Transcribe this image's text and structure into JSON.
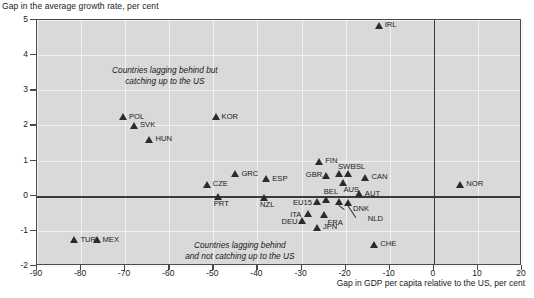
{
  "axes": {
    "y_title": "Gap in the average growth rate, per cent",
    "x_title": "Gap in GDP per capita relative to the US, per cent",
    "y_ticks": [
      "5",
      "4",
      "3",
      "2",
      "1",
      "0",
      "-1",
      "-2"
    ],
    "x_ticks": [
      "-90",
      "-80",
      "-70",
      "-60",
      "-50",
      "-40",
      "-30",
      "-20",
      "-10",
      "0",
      "10",
      "20"
    ],
    "ylim": [
      -2,
      5
    ],
    "xlim": [
      -90,
      20
    ],
    "grid": true
  },
  "annotations": {
    "upper_line1": "Countries lagging behind but",
    "upper_line2": "catching up to the US",
    "lower_line1": "Countries lagging behind",
    "lower_line2": "and not catching up to the US"
  },
  "colors": {
    "plot_background": "#d9d9d9",
    "marker": "#2b2b2b",
    "gridline": "#f2f2f2",
    "axis": "#4a4a4a",
    "zero_line": "#3a3a3a"
  },
  "chart_data": {
    "type": "scatter",
    "title": "",
    "xlabel": "Gap in GDP per capita relative to the US, per cent",
    "ylabel": "Gap in the average growth rate, per cent",
    "xlim": [
      -90,
      20
    ],
    "ylim": [
      -2,
      5
    ],
    "grid": true,
    "legend": "none",
    "points": [
      {
        "label": "IRL",
        "x": -12.5,
        "y": 4.85,
        "lx": 6,
        "ly": -4
      },
      {
        "label": "POL",
        "x": -70.5,
        "y": 2.25,
        "lx": 6,
        "ly": -4
      },
      {
        "label": "KOR",
        "x": -49.5,
        "y": 2.25,
        "lx": 6,
        "ly": -4
      },
      {
        "label": "SVK",
        "x": -68.0,
        "y": 2.0,
        "lx": 6,
        "ly": -4
      },
      {
        "label": "HUN",
        "x": -64.5,
        "y": 1.6,
        "lx": 6,
        "ly": -4
      },
      {
        "label": "FIN",
        "x": -26.0,
        "y": 0.98,
        "lx": 6,
        "ly": -4
      },
      {
        "label": "GRC",
        "x": -45.0,
        "y": 0.63,
        "lx": 6,
        "ly": -4
      },
      {
        "label": "SWE",
        "x": -21.5,
        "y": 0.62,
        "lx": -1,
        "ly": -11
      },
      {
        "label": "ISL",
        "x": -19.5,
        "y": 0.62,
        "lx": 6,
        "ly": -11
      },
      {
        "label": "GBR",
        "x": -24.5,
        "y": 0.58,
        "lx": -20,
        "ly": -4
      },
      {
        "label": "CAN",
        "x": -15.5,
        "y": 0.52,
        "lx": 6,
        "ly": -4
      },
      {
        "label": "ESP",
        "x": -38.0,
        "y": 0.48,
        "lx": 6,
        "ly": -4
      },
      {
        "label": "CZE",
        "x": -51.5,
        "y": 0.33,
        "lx": 6,
        "ly": -4
      },
      {
        "label": "NOR",
        "x": 6.0,
        "y": 0.33,
        "lx": 6,
        "ly": -4
      },
      {
        "label": "AUS",
        "x": -20.5,
        "y": 0.38,
        "lx": 0,
        "ly": 4
      },
      {
        "label": "AUT",
        "x": -17.0,
        "y": 0.05,
        "lx": 6,
        "ly": -4
      },
      {
        "label": "PRT",
        "x": -49.0,
        "y": -0.02,
        "lx": -4,
        "ly": 4
      },
      {
        "label": "NZL",
        "x": -38.5,
        "y": -0.05,
        "lx": -4,
        "ly": 4
      },
      {
        "label": "BEL",
        "x": -24.5,
        "y": -0.1,
        "lx": -2,
        "ly": -11
      },
      {
        "label": "EU15",
        "x": -26.5,
        "y": -0.18,
        "lx": -24,
        "ly": -3
      },
      {
        "label": "DNK",
        "x": -21.5,
        "y": -0.18,
        "lx": 14,
        "ly": 3
      },
      {
        "label": "NLD",
        "x": -19.5,
        "y": -0.2,
        "lx": 20,
        "ly": 12
      },
      {
        "label": "ITA",
        "x": -28.5,
        "y": -0.52,
        "lx": -18,
        "ly": -3
      },
      {
        "label": "FRA",
        "x": -25.0,
        "y": -0.55,
        "lx": 4,
        "ly": 4
      },
      {
        "label": "DEU",
        "x": -30.0,
        "y": -0.72,
        "lx": -20,
        "ly": -3
      },
      {
        "label": "JPN",
        "x": -26.5,
        "y": -0.9,
        "lx": 6,
        "ly": -4
      },
      {
        "label": "TUR",
        "x": -81.5,
        "y": -1.25,
        "lx": 6,
        "ly": -4
      },
      {
        "label": "MEX",
        "x": -76.5,
        "y": -1.25,
        "lx": 6,
        "ly": -4
      },
      {
        "label": "CHE",
        "x": -13.5,
        "y": -1.38,
        "lx": 6,
        "ly": -4
      }
    ]
  }
}
